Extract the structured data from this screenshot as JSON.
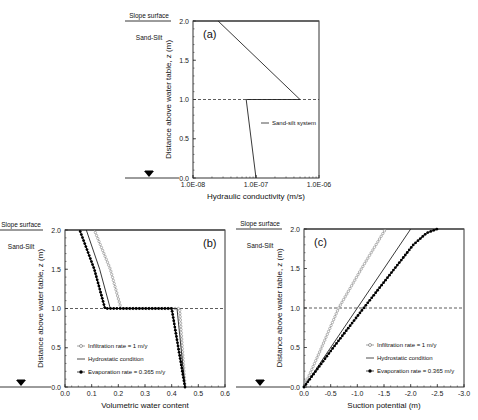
{
  "figure": {
    "side_labels": {
      "slope_surface": "Slope surface",
      "material": "Sand-Silt"
    }
  },
  "chart_data": [
    {
      "id": "a",
      "type": "line",
      "panel_label": "(a)",
      "title": "",
      "xlabel": "Hydraulic conductivity (m/s)",
      "ylabel": "Distance above water table, z (m)",
      "xscale": "log",
      "xlim": [
        1e-08,
        1e-06
      ],
      "ylim": [
        0,
        2
      ],
      "xticks": [
        1e-08,
        1e-07,
        1e-06
      ],
      "xtick_labels": [
        "1.0E-08",
        "1.0E-07",
        "1.0E-06"
      ],
      "yticks": [
        0,
        0.5,
        1.0,
        1.5,
        2.0
      ],
      "ytick_labels": [
        "0.0",
        "0.5",
        "1.0",
        "1.5",
        "2.0"
      ],
      "reference_line": {
        "y": 1.0,
        "style": "dashed"
      },
      "legend_position": "center-right",
      "series": [
        {
          "name": "Sand-silt system",
          "style": "line",
          "points": [
            [
              1e-07,
              0.0
            ],
            [
              7e-08,
              1.0
            ],
            [
              5e-07,
              1.0
            ],
            [
              2.5e-08,
              2.0
            ]
          ]
        }
      ]
    },
    {
      "id": "b",
      "type": "line",
      "panel_label": "(b)",
      "title": "",
      "xlabel": "Volumetric water content",
      "ylabel": "Distance above water table, z (m)",
      "xlim": [
        0,
        0.6
      ],
      "ylim": [
        0,
        2
      ],
      "xticks": [
        0,
        0.1,
        0.2,
        0.3,
        0.4,
        0.5,
        0.6
      ],
      "xtick_labels": [
        "0.0",
        "0.1",
        "0.2",
        "0.3",
        "0.4",
        "0.5",
        "0.6"
      ],
      "yticks": [
        0,
        0.5,
        1.0,
        1.5,
        2.0
      ],
      "ytick_labels": [
        "0.0",
        "0.5",
        "1.0",
        "1.5",
        "2.0"
      ],
      "reference_line": {
        "y": 1.0,
        "style": "dashed"
      },
      "legend_position": "lower-left",
      "series": [
        {
          "name": "Infiltration rate = 1 m/y",
          "style": "open-circle",
          "points": [
            [
              0.45,
              0.0
            ],
            [
              0.44,
              0.5
            ],
            [
              0.43,
              1.0
            ],
            [
              0.21,
              1.0
            ],
            [
              0.17,
              1.5
            ],
            [
              0.11,
              2.0
            ]
          ]
        },
        {
          "name": "Hydrostatic condition",
          "style": "line",
          "points": [
            [
              0.45,
              0.0
            ],
            [
              0.435,
              0.5
            ],
            [
              0.42,
              1.0
            ],
            [
              0.17,
              1.0
            ],
            [
              0.13,
              1.5
            ],
            [
              0.08,
              2.0
            ]
          ]
        },
        {
          "name": "Evaporation rate = 0.365 m/y",
          "style": "filled-circle",
          "points": [
            [
              0.45,
              0.0
            ],
            [
              0.425,
              0.5
            ],
            [
              0.4,
              1.0
            ],
            [
              0.15,
              1.0
            ],
            [
              0.11,
              1.5
            ],
            [
              0.055,
              2.0
            ]
          ]
        }
      ]
    },
    {
      "id": "c",
      "type": "line",
      "panel_label": "(c)",
      "title": "",
      "xlabel": "Suction potential (m)",
      "ylabel": "Distance above water table, z (m)",
      "xlim": [
        0,
        -3.0
      ],
      "ylim": [
        0,
        2
      ],
      "xticks": [
        0,
        -0.5,
        -1.0,
        -1.5,
        -2.0,
        -2.5,
        -3.0
      ],
      "xtick_labels": [
        "0.0",
        "-0.5",
        "-1.0",
        "-1.5",
        "-2.0",
        "-2.5",
        "-3.0"
      ],
      "yticks": [
        0,
        0.5,
        1.0,
        1.5,
        2.0
      ],
      "ytick_labels": [
        "0.0",
        "0.5",
        "1.0",
        "1.5",
        "2.0"
      ],
      "reference_line": {
        "y": 1.0,
        "style": "dashed"
      },
      "legend_position": "lower-right",
      "series": [
        {
          "name": "Infiltration rate = 1 m/y",
          "style": "open-circle",
          "points": [
            [
              0,
              0
            ],
            [
              -0.33,
              0.5
            ],
            [
              -0.65,
              1.0
            ],
            [
              -1.08,
              1.5
            ],
            [
              -1.53,
              2.0
            ]
          ]
        },
        {
          "name": "Hydrostatic condition",
          "style": "line",
          "points": [
            [
              0,
              0
            ],
            [
              -2.0,
              2.0
            ]
          ]
        },
        {
          "name": "Evaporation rate = 0.365 m/y",
          "style": "filled-circle",
          "points": [
            [
              0,
              0
            ],
            [
              -0.55,
              0.5
            ],
            [
              -1.12,
              1.0
            ],
            [
              -1.7,
              1.5
            ],
            [
              -2.05,
              1.8
            ],
            [
              -2.3,
              1.95
            ],
            [
              -2.5,
              2.0
            ]
          ]
        }
      ]
    }
  ],
  "layout_px": {
    "a": {
      "x0": 193,
      "y0": 21,
      "x1": 319,
      "y1": 178
    },
    "b": {
      "x0": 65,
      "y0": 230,
      "x1": 225,
      "y1": 387
    },
    "c": {
      "x0": 304,
      "y0": 229,
      "x1": 464,
      "y1": 387
    }
  }
}
